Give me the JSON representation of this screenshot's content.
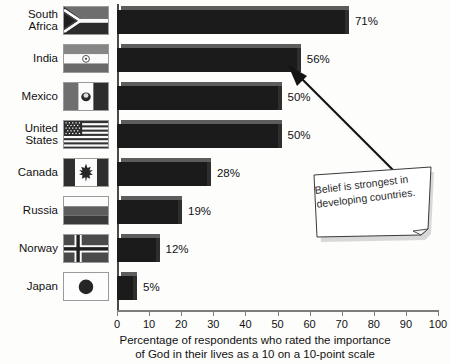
{
  "chart": {
    "type": "bar",
    "orientation": "horizontal",
    "title": "",
    "xlabel": "Percentage of respondents who rated the importance\nof God in their lives as a 10 on a 10-point scale",
    "ylabel": "",
    "xlim": [
      0,
      100
    ],
    "xticks": [
      "0",
      "10",
      "20",
      "30",
      "40",
      "50",
      "60",
      "70",
      "80",
      "90",
      "100"
    ],
    "grid": false,
    "legend": "none",
    "bar_color": "#1b1b1b",
    "axis_color": "#4a4a4a"
  },
  "chart_data": {
    "type": "bar",
    "categories": [
      "South Africa",
      "India",
      "Mexico",
      "United States",
      "Canada",
      "Russia",
      "Norway",
      "Japan"
    ],
    "values": [
      71,
      56,
      50,
      50,
      28,
      19,
      12,
      5
    ],
    "value_labels": [
      "71%",
      "56%",
      "50%",
      "50%",
      "28%",
      "19%",
      "12%",
      "5%"
    ],
    "title": "",
    "xlabel": "Percentage of respondents who rated the importance of God in their lives as a 10 on a 10-point scale",
    "ylabel": "",
    "xlim": [
      0,
      100
    ],
    "grid": false
  },
  "categories": [
    {
      "label": "South\nAfrica",
      "flag": "flag-south-africa",
      "value": 71,
      "value_label": "71%"
    },
    {
      "label": "India",
      "flag": "flag-india",
      "value": 56,
      "value_label": "56%"
    },
    {
      "label": "Mexico",
      "flag": "flag-mexico",
      "value": 50,
      "value_label": "50%"
    },
    {
      "label": "United\nStates",
      "flag": "flag-united-states",
      "value": 50,
      "value_label": "50%"
    },
    {
      "label": "Canada",
      "flag": "flag-canada",
      "value": 28,
      "value_label": "28%"
    },
    {
      "label": "Russia",
      "flag": "flag-russia",
      "value": 19,
      "value_label": "19%"
    },
    {
      "label": "Norway",
      "flag": "flag-norway",
      "value": 12,
      "value_label": "12%"
    },
    {
      "label": "Japan",
      "flag": "flag-japan",
      "value": 5,
      "value_label": "5%"
    }
  ],
  "callout": {
    "text": "Belief is strongest in\ndeveloping countries.",
    "icon": "sticky-note-icon",
    "arrow": "arrow-up-left-icon"
  }
}
